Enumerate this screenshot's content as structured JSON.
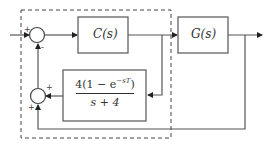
{
  "diagram": {
    "type": "control-system-block-diagram",
    "colors": {
      "line": "#555555",
      "text": "#333333",
      "background": "#ffffff"
    },
    "blocks": [
      {
        "id": "controller",
        "label": "C(s)"
      },
      {
        "id": "plant",
        "label": "G(s)"
      },
      {
        "id": "feedback-filter",
        "numerator_prefix": "4(1 − e",
        "numerator_exponent": "−sT",
        "numerator_suffix": ")",
        "denominator": "s + 4"
      }
    ],
    "summing_junctions": [
      {
        "id": "sum-1",
        "signs": {
          "input_left": "+",
          "input_bottom": "-"
        }
      },
      {
        "id": "sum-2",
        "signs": {
          "input_right": "+",
          "input_bottom": "+"
        }
      }
    ],
    "dashed_region": {
      "encloses": [
        "sum-1",
        "controller",
        "sum-2",
        "feedback-filter"
      ]
    }
  }
}
